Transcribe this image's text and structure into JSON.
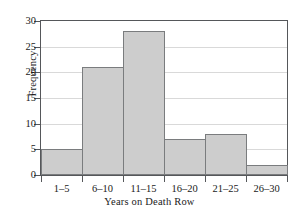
{
  "chart_data": {
    "type": "bar",
    "title": "",
    "xlabel": "Years on Death Row",
    "ylabel": "Frequency",
    "categories": [
      "1–5",
      "6–10",
      "11–15",
      "16–20",
      "21–25",
      "26–30"
    ],
    "values": [
      5,
      21,
      28,
      7,
      8,
      2
    ],
    "ylim": [
      0,
      30
    ],
    "yticks": [
      0,
      5,
      10,
      15,
      20,
      25,
      30
    ],
    "ytick_labels": [
      "0",
      "5",
      "10",
      "15",
      "20",
      "25",
      "30"
    ],
    "grid": true,
    "grid_axis": "y",
    "legend": false,
    "bar_gap": 0,
    "colors": {
      "bar_fill": "#cdcdcd",
      "bar_edge": "#7a7c7e",
      "axis": "#55575a",
      "grid": "#d9d9d9",
      "background": "#ffffff",
      "text": "#1a1a1a"
    }
  }
}
